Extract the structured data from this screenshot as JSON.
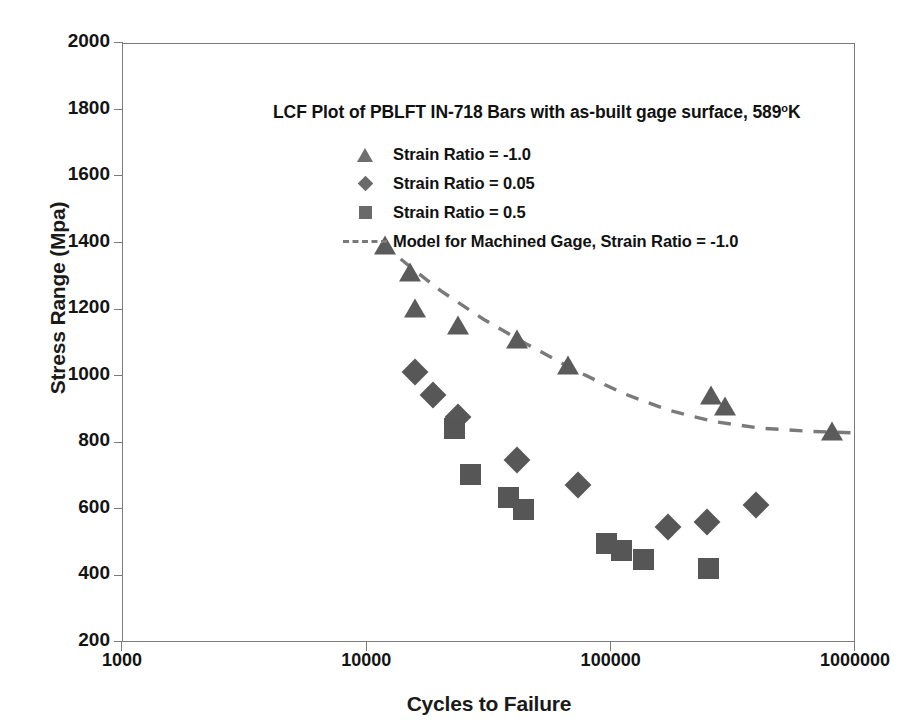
{
  "chart_data": {
    "type": "scatter",
    "title_main": "LCF Plot of PBLFT IN-718  Bars  with as-built gage surface, 589",
    "title_sup": "o",
    "title_tail": "K",
    "xlabel": "Cycles to Failure",
    "ylabel": "Stress Range (Mpa)",
    "xscale": "log",
    "yscale": "linear",
    "xlim": [
      1000,
      1000000
    ],
    "ylim": [
      200,
      2000
    ],
    "grid": false,
    "legend_position": "upper-center",
    "xticks": [
      1000,
      10000,
      100000,
      1000000
    ],
    "xtick_labels": [
      "1000",
      "10000",
      "100000",
      "1000000"
    ],
    "yticks": [
      200,
      400,
      600,
      800,
      1000,
      1200,
      1400,
      1600,
      1800,
      2000
    ],
    "ytick_labels": [
      "200",
      "400",
      "600",
      "800",
      "1000",
      "1200",
      "1400",
      "1600",
      "1800",
      "2000"
    ],
    "series": [
      {
        "name": "Strain Ratio = -1.0",
        "marker": "triangle",
        "color": "#5b5b5b",
        "points": [
          [
            11800,
            1390
          ],
          [
            15000,
            1310
          ],
          [
            15600,
            1200
          ],
          [
            23500,
            1150
          ],
          [
            41000,
            1108
          ],
          [
            66000,
            1030
          ],
          [
            255000,
            940
          ],
          [
            290000,
            905
          ],
          [
            800000,
            830
          ]
        ]
      },
      {
        "name": "Strain Ratio = 0.05",
        "marker": "diamond",
        "color": "#575757",
        "points": [
          [
            15600,
            1015
          ],
          [
            18600,
            945
          ],
          [
            23500,
            880
          ],
          [
            41000,
            750
          ],
          [
            73000,
            675
          ],
          [
            170000,
            548
          ],
          [
            245000,
            563
          ],
          [
            390000,
            615
          ]
        ]
      },
      {
        "name": "Strain Ratio = 0.5",
        "marker": "square",
        "color": "#565656",
        "points": [
          [
            22800,
            845
          ],
          [
            26500,
            705
          ],
          [
            38000,
            637
          ],
          [
            43500,
            600
          ],
          [
            95000,
            500
          ],
          [
            110000,
            478
          ],
          [
            135000,
            452
          ],
          [
            250000,
            425
          ]
        ]
      },
      {
        "name": "Model for Machined Gage, Strain Ratio = -1.0",
        "marker": "dashed-line",
        "color": "#7a7a7a",
        "points": [
          [
            11500,
            1400
          ],
          [
            15000,
            1330
          ],
          [
            20000,
            1258
          ],
          [
            30000,
            1172
          ],
          [
            45000,
            1098
          ],
          [
            70000,
            1022
          ],
          [
            110000,
            952
          ],
          [
            170000,
            900
          ],
          [
            260000,
            866
          ],
          [
            400000,
            846
          ],
          [
            650000,
            836
          ],
          [
            950000,
            832
          ]
        ]
      }
    ]
  },
  "legend": {
    "items": [
      {
        "key": "triangle",
        "label": "Strain Ratio = -1.0"
      },
      {
        "key": "diamond",
        "label": "Strain Ratio = 0.05"
      },
      {
        "key": "square",
        "label": "Strain Ratio = 0.5"
      },
      {
        "key": "dash",
        "label": "Model for Machined Gage, Strain Ratio = -1.0"
      }
    ]
  },
  "axes": {
    "y_title": "Stress Range (Mpa)",
    "x_title": "Cycles to Failure"
  }
}
